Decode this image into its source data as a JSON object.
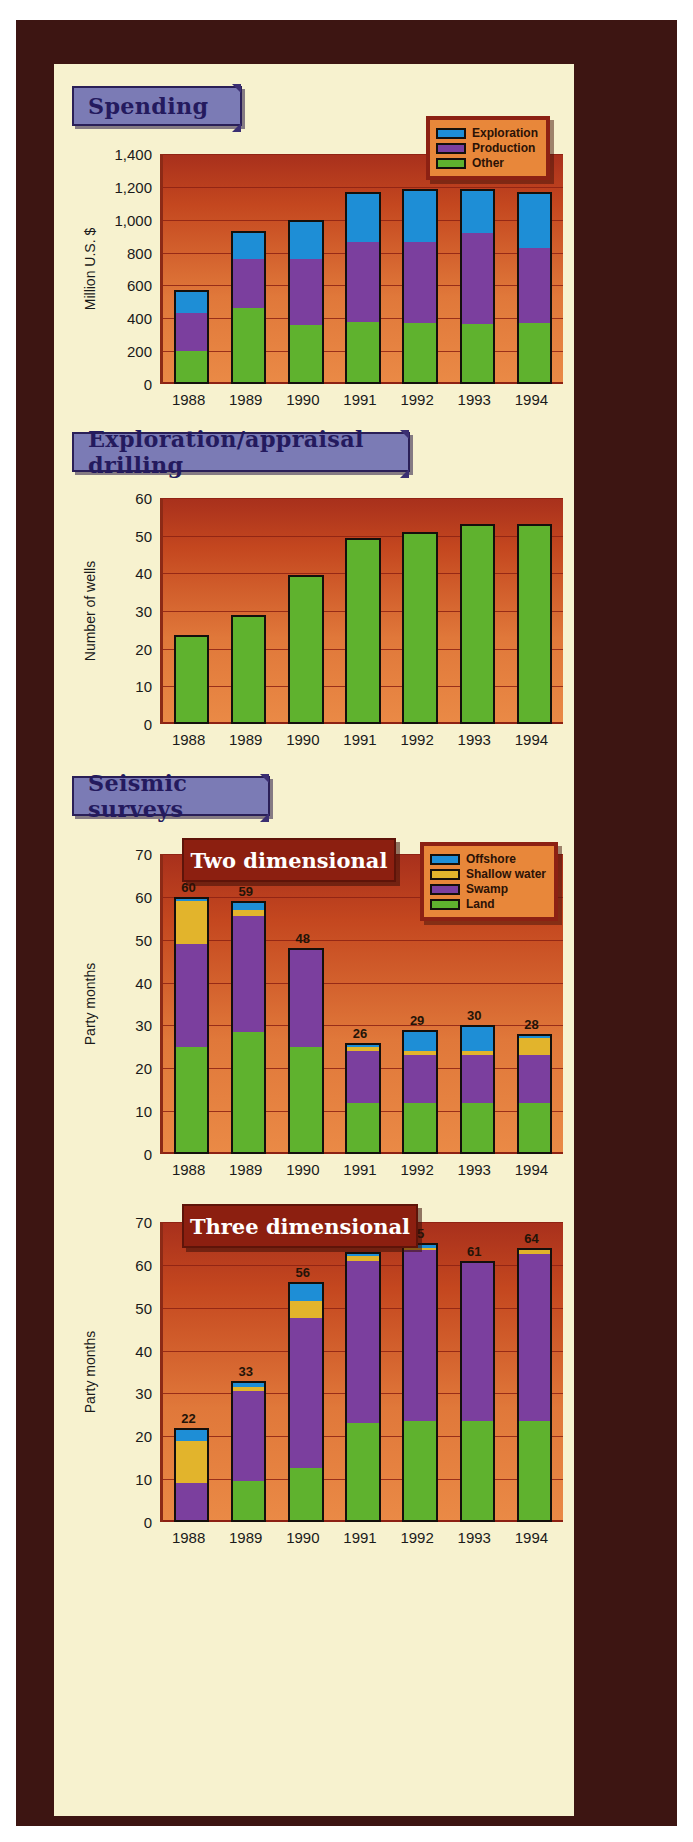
{
  "page": {
    "background_color": "#f7f2cf",
    "frame_color": "#3d1512"
  },
  "sections": [
    {
      "banner": "Spending",
      "chart_data": {
        "type": "bar",
        "stacked": true,
        "title": "Spending",
        "xlabel": "",
        "ylabel": "Million U.S. $",
        "ylim": [
          0,
          1400
        ],
        "yticks": [
          "0",
          "200",
          "400",
          "600",
          "800",
          "1,000",
          "1,200",
          "1,400"
        ],
        "ytick_values": [
          0,
          200,
          400,
          600,
          800,
          1000,
          1200,
          1400
        ],
        "categories": [
          "1988",
          "1989",
          "1990",
          "1991",
          "1992",
          "1993",
          "1994"
        ],
        "grid": true,
        "legend_position": "top-right",
        "series": [
          {
            "name": "Other",
            "color": "#5fb22e",
            "values": [
              200,
              460,
              360,
              375,
              370,
              365,
              370
            ]
          },
          {
            "name": "Production",
            "color": "#7b3f9e",
            "values": [
              230,
              300,
              400,
              490,
              495,
              555,
              455
            ]
          },
          {
            "name": "Exploration",
            "color": "#1e8ed6",
            "values": [
              140,
              170,
              240,
              305,
              325,
              270,
              345
            ]
          }
        ],
        "totals": [
          570,
          930,
          1000,
          1170,
          1190,
          1190,
          1170
        ]
      }
    },
    {
      "banner": "Exploration/appraisal drilling",
      "chart_data": {
        "type": "bar",
        "stacked": false,
        "title": "Exploration/appraisal drilling",
        "xlabel": "",
        "ylabel": "Number of wells",
        "ylim": [
          0,
          60
        ],
        "yticks": [
          "0",
          "10",
          "20",
          "30",
          "40",
          "50",
          "60"
        ],
        "ytick_values": [
          0,
          10,
          20,
          30,
          40,
          50,
          60
        ],
        "categories": [
          "1988",
          "1989",
          "1990",
          "1991",
          "1992",
          "1993",
          "1994"
        ],
        "grid": true,
        "series": [
          {
            "name": "Number of wells",
            "color": "#5fb22e",
            "values": [
              23.5,
              29,
              39.5,
              49.5,
              51,
              53,
              53
            ]
          }
        ]
      }
    },
    {
      "banner": "Seismic surveys",
      "subtitle": "Two dimensional",
      "chart_data": {
        "type": "bar",
        "stacked": true,
        "title": "Two dimensional",
        "xlabel": "",
        "ylabel": "Party months",
        "ylim": [
          0,
          70
        ],
        "yticks": [
          "0",
          "10",
          "20",
          "30",
          "40",
          "50",
          "60",
          "70"
        ],
        "ytick_values": [
          0,
          10,
          20,
          30,
          40,
          50,
          60,
          70
        ],
        "categories": [
          "1988",
          "1989",
          "1990",
          "1991",
          "1992",
          "1993",
          "1994"
        ],
        "grid": true,
        "legend_position": "top-right",
        "data_labels": [
          "60",
          "59",
          "48",
          "26",
          "29",
          "30",
          "28"
        ],
        "series": [
          {
            "name": "Land",
            "color": "#5fb22e",
            "values": [
              25,
              28.5,
              25,
              12,
              12,
              12,
              12
            ]
          },
          {
            "name": "Swamp",
            "color": "#7b3f9e",
            "values": [
              24,
              27,
              23,
              12,
              11,
              11,
              11
            ]
          },
          {
            "name": "Shallow water",
            "color": "#e2b42c",
            "values": [
              10,
              1.5,
              0,
              1,
              1,
              1,
              4
            ]
          },
          {
            "name": "Offshore",
            "color": "#1e8ed6",
            "values": [
              1,
              2,
              0,
              1,
              5,
              6,
              1
            ]
          }
        ],
        "totals": [
          60,
          59,
          48,
          26,
          29,
          30,
          28
        ]
      }
    },
    {
      "subtitle": "Three dimensional",
      "chart_data": {
        "type": "bar",
        "stacked": true,
        "title": "Three dimensional",
        "xlabel": "",
        "ylabel": "Party months",
        "ylim": [
          0,
          70
        ],
        "yticks": [
          "0",
          "10",
          "20",
          "30",
          "40",
          "50",
          "60",
          "70"
        ],
        "ytick_values": [
          0,
          10,
          20,
          30,
          40,
          50,
          60,
          70
        ],
        "categories": [
          "1988",
          "1989",
          "1990",
          "1991",
          "1992",
          "1993",
          "1994"
        ],
        "grid": true,
        "data_labels": [
          "22",
          "33",
          "56",
          "63",
          "65",
          "61",
          "64"
        ],
        "series": [
          {
            "name": "Land",
            "color": "#5fb22e",
            "values": [
              0,
              9.5,
              12.5,
              23,
              23.5,
              23.5,
              23.5
            ]
          },
          {
            "name": "Swamp",
            "color": "#7b3f9e",
            "values": [
              9,
              21,
              35,
              38,
              40,
              37,
              39
            ]
          },
          {
            "name": "Shallow water",
            "color": "#e2b42c",
            "values": [
              10,
              1,
              4,
              1,
              0.5,
              0,
              1
            ]
          },
          {
            "name": "Offshore",
            "color": "#1e8ed6",
            "values": [
              3,
              1.5,
              4.5,
              1,
              1,
              0.5,
              0.5
            ]
          }
        ],
        "totals": [
          22,
          33,
          56,
          63,
          65,
          61,
          64
        ]
      }
    }
  ],
  "legends": {
    "spending": {
      "items": [
        {
          "label": "Exploration",
          "color": "#1e8ed6"
        },
        {
          "label": "Production",
          "color": "#7b3f9e"
        },
        {
          "label": "Other",
          "color": "#5fb22e"
        }
      ]
    },
    "seismic": {
      "items": [
        {
          "label": "Offshore",
          "color": "#1e8ed6"
        },
        {
          "label": "Shallow water",
          "color": "#e2b42c"
        },
        {
          "label": "Swamp",
          "color": "#7b3f9e"
        },
        {
          "label": "Land",
          "color": "#5fb22e"
        }
      ]
    }
  }
}
